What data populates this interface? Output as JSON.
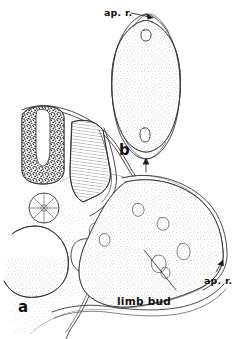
{
  "figure": {
    "kind": "scientific-line-drawing",
    "background_color": "#ffffff",
    "ink_color": "#2b2b2b",
    "width": 236,
    "height": 339,
    "panels": [
      {
        "id": "a",
        "letter": "a",
        "description": "transverse section of embryo trunk with limb bud"
      },
      {
        "id": "b",
        "letter": "b",
        "description": "isolated limb bud section with apical ridge at both poles"
      }
    ],
    "labels": [
      {
        "id": "ap-r-top",
        "text": "ap. r.",
        "panel": "b",
        "pointer": "arrow-right-down"
      },
      {
        "id": "ap-r-bottom",
        "text": "ap.r.",
        "panel": "b",
        "pointer": "arrow-up"
      },
      {
        "id": "ap-r-right",
        "text": "ap. r.",
        "panel": "a",
        "pointer": "arrow-up-right"
      },
      {
        "id": "limb-bud",
        "text": "limb bud",
        "panel": "a",
        "pointer": "leader-line"
      }
    ],
    "panel_letters": {
      "a": "a",
      "b": "b"
    }
  }
}
